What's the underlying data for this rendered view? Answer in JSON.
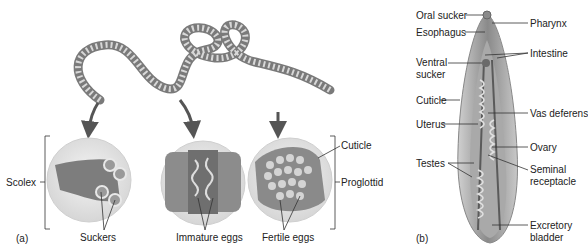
{
  "panel_a": {
    "tag": "(a)",
    "labels": {
      "scolex": "Scolex",
      "suckers": "Suckers",
      "immature_eggs": "Immature eggs",
      "fertile_eggs": "Fertile eggs",
      "cuticle": "Cuticle",
      "proglottid": "Proglottid"
    }
  },
  "panel_b": {
    "tag": "(b)",
    "labels": {
      "oral_sucker": "Oral sucker",
      "esophagus": "Esophagus",
      "ventral_sucker_1": "Ventral",
      "ventral_sucker_2": "sucker",
      "cuticle": "Cuticle",
      "uterus": "Uterus",
      "testes": "Testes",
      "pharynx": "Pharynx",
      "intestine": "Intestine",
      "vas_deferens": "Vas deferens",
      "ovary": "Ovary",
      "seminal_receptacle_1": "Seminal",
      "seminal_receptacle_2": "receptacle",
      "excretory_bladder_1": "Excretory",
      "excretory_bladder_2": "bladder"
    }
  },
  "colors": {
    "worm": "#9a9a9a",
    "arrow": "#555555",
    "circle_fill": "#e6e6e6",
    "leader": "#333333"
  }
}
